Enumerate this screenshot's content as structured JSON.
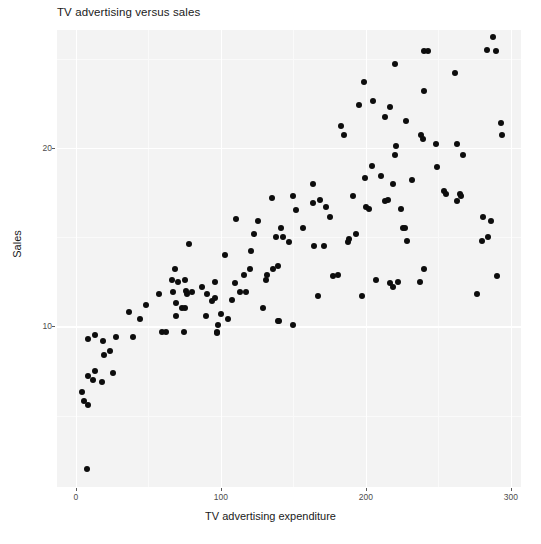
{
  "chart_data": {
    "type": "scatter",
    "title": "TV advertising versus sales",
    "xlabel": "TV advertising expenditure",
    "ylabel": "Sales",
    "xlim": [
      -13,
      307
    ],
    "ylim": [
      1.0,
      26.6
    ],
    "xticks": [
      0,
      100,
      200,
      300
    ],
    "xtick_labels": [
      "0",
      "100",
      "200",
      "300"
    ],
    "yticks": [
      10,
      20
    ],
    "ytick_labels": [
      "10",
      "20"
    ],
    "x_minor_ticks": [
      50,
      150,
      250
    ],
    "y_minor_ticks": [
      5,
      15,
      25
    ],
    "grid": true,
    "legend": false,
    "marker": "filled-circle",
    "marker_color": "#0d0d0d",
    "marker_size": 6,
    "panel_background": "#f3f3f3",
    "gridline_color": "#ffffff",
    "n_points": 120,
    "points": [
      [
        7.8,
        2.0
      ],
      [
        5.4,
        5.8
      ],
      [
        4.1,
        6.3
      ],
      [
        8.7,
        5.6
      ],
      [
        8.4,
        7.2
      ],
      [
        13.2,
        7.5
      ],
      [
        11.7,
        7.0
      ],
      [
        17.9,
        6.9
      ],
      [
        25.6,
        7.4
      ],
      [
        19.6,
        8.4
      ],
      [
        8.6,
        9.3
      ],
      [
        13.1,
        9.5
      ],
      [
        18.7,
        9.2
      ],
      [
        27.5,
        9.4
      ],
      [
        23.8,
        8.6
      ],
      [
        36.9,
        10.8
      ],
      [
        44.5,
        10.4
      ],
      [
        39.5,
        9.4
      ],
      [
        48.3,
        11.2
      ],
      [
        57.5,
        11.8
      ],
      [
        59.6,
        9.7
      ],
      [
        62.3,
        9.7
      ],
      [
        66.1,
        12.6
      ],
      [
        66.9,
        11.9
      ],
      [
        68.4,
        13.2
      ],
      [
        69.2,
        11.3
      ],
      [
        69.0,
        10.6
      ],
      [
        70.6,
        12.5
      ],
      [
        73.4,
        11.0
      ],
      [
        74.7,
        9.7
      ],
      [
        75.1,
        12.6
      ],
      [
        75.3,
        11.0
      ],
      [
        76.3,
        12.0
      ],
      [
        76.4,
        11.8
      ],
      [
        78.2,
        14.6
      ],
      [
        80.2,
        11.9
      ],
      [
        87.2,
        12.2
      ],
      [
        89.7,
        10.6
      ],
      [
        90.4,
        11.8
      ],
      [
        93.9,
        11.4
      ],
      [
        95.7,
        12.5
      ],
      [
        96.2,
        11.6
      ],
      [
        97.2,
        9.7
      ],
      [
        97.5,
        9.6
      ],
      [
        98.2,
        10.1
      ],
      [
        100.4,
        10.7
      ],
      [
        102.7,
        14.0
      ],
      [
        104.6,
        10.4
      ],
      [
        107.4,
        11.5
      ],
      [
        109.8,
        12.4
      ],
      [
        110.7,
        16.0
      ],
      [
        112.9,
        11.9
      ],
      [
        116.0,
        12.9
      ],
      [
        117.2,
        11.9
      ],
      [
        120.2,
        13.2
      ],
      [
        120.5,
        14.2
      ],
      [
        123.1,
        15.2
      ],
      [
        125.7,
        15.9
      ],
      [
        129.4,
        11.0
      ],
      [
        131.1,
        12.6
      ],
      [
        131.7,
        12.9
      ],
      [
        135.2,
        17.2
      ],
      [
        136.2,
        13.2
      ],
      [
        137.9,
        15.0
      ],
      [
        139.2,
        10.3
      ],
      [
        139.3,
        13.4
      ],
      [
        140.3,
        10.3
      ],
      [
        141.3,
        15.5
      ],
      [
        142.9,
        15.0
      ],
      [
        147.3,
        14.7
      ],
      [
        149.7,
        17.3
      ],
      [
        149.8,
        10.1
      ],
      [
        151.5,
        16.5
      ],
      [
        156.6,
        15.5
      ],
      [
        163.3,
        16.9
      ],
      [
        163.5,
        18.0
      ],
      [
        164.5,
        14.5
      ],
      [
        166.8,
        11.7
      ],
      [
        168.4,
        17.1
      ],
      [
        171.3,
        14.5
      ],
      [
        172.5,
        16.7
      ],
      [
        175.1,
        16.1
      ],
      [
        177.0,
        12.8
      ],
      [
        180.8,
        12.9
      ],
      [
        182.6,
        21.2
      ],
      [
        184.9,
        20.7
      ],
      [
        187.8,
        14.7
      ],
      [
        188.4,
        14.9
      ],
      [
        191.1,
        17.3
      ],
      [
        193.2,
        15.2
      ],
      [
        195.4,
        22.4
      ],
      [
        197.6,
        11.7
      ],
      [
        198.9,
        23.7
      ],
      [
        199.1,
        18.3
      ],
      [
        199.8,
        16.7
      ],
      [
        202.5,
        16.6
      ],
      [
        204.1,
        19.0
      ],
      [
        205.0,
        22.6
      ],
      [
        206.9,
        12.6
      ],
      [
        210.7,
        18.4
      ],
      [
        213.4,
        21.7
      ],
      [
        213.5,
        17.0
      ],
      [
        215.4,
        17.1
      ],
      [
        216.4,
        22.3
      ],
      [
        216.8,
        12.4
      ],
      [
        218.4,
        18.0
      ],
      [
        218.5,
        12.2
      ],
      [
        219.8,
        19.6
      ],
      [
        220.3,
        24.7
      ],
      [
        220.5,
        20.1
      ],
      [
        222.4,
        12.5
      ],
      [
        224.0,
        16.6
      ],
      [
        225.8,
        15.5
      ],
      [
        227.2,
        15.5
      ],
      [
        228.0,
        21.5
      ],
      [
        228.3,
        14.8
      ],
      [
        232.1,
        18.2
      ],
      [
        237.4,
        12.5
      ],
      [
        238.2,
        20.7
      ],
      [
        239.3,
        20.5
      ],
      [
        240.1,
        13.2
      ],
      [
        239.8,
        23.2
      ],
      [
        239.9,
        25.4
      ],
      [
        243.2,
        25.4
      ],
      [
        248.4,
        20.2
      ],
      [
        248.8,
        18.9
      ],
      [
        253.8,
        17.6
      ],
      [
        255.4,
        17.4
      ],
      [
        261.3,
        24.2
      ],
      [
        262.7,
        20.2
      ],
      [
        262.9,
        17.0
      ],
      [
        265.2,
        17.4
      ],
      [
        265.6,
        17.3
      ],
      [
        266.9,
        19.6
      ],
      [
        276.7,
        11.8
      ],
      [
        276.9,
        27.0
      ],
      [
        280.2,
        14.8
      ],
      [
        280.7,
        16.1
      ],
      [
        283.6,
        25.5
      ],
      [
        284.3,
        15.0
      ],
      [
        286.0,
        15.9
      ],
      [
        287.6,
        26.2
      ],
      [
        289.7,
        25.4
      ],
      [
        290.7,
        12.8
      ],
      [
        292.9,
        21.4
      ],
      [
        293.6,
        20.7
      ]
    ]
  }
}
